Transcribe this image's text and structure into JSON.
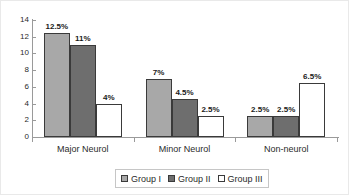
{
  "chart_data": {
    "type": "bar",
    "title": "",
    "xlabel": "",
    "ylabel": "",
    "ylim": [
      0,
      14
    ],
    "yticks": [
      0,
      2,
      4,
      6,
      8,
      10,
      12,
      14
    ],
    "grid": false,
    "legend_position": "bottom",
    "categories": [
      "Major Neurol",
      "Minor Neurol",
      "Non-neurol"
    ],
    "series": [
      {
        "name": "Group I",
        "color": "#a8a8a8",
        "values": [
          12.5,
          7,
          2.5
        ],
        "labels": [
          "12.5%",
          "7%",
          "2.5%"
        ]
      },
      {
        "name": "Group II",
        "color": "#6e6e6e",
        "values": [
          11,
          4.5,
          2.5
        ],
        "labels": [
          "11%",
          "4.5%",
          "2.5%"
        ]
      },
      {
        "name": "Group III",
        "color": "#ffffff",
        "values": [
          4,
          2.5,
          6.5
        ],
        "labels": [
          "4%",
          "2.5%",
          "6.5%"
        ]
      }
    ]
  },
  "axis": {
    "y_tick_labels": [
      "14",
      "12",
      "10",
      "8",
      "6",
      "4",
      "2",
      "0"
    ]
  },
  "categories": {
    "c0": "Major Neurol",
    "c1": "Minor Neurol",
    "c2": "Non-neurol"
  },
  "legend": {
    "items": [
      {
        "label": "Group I",
        "swatch": "legend-swatch-group-i"
      },
      {
        "label": "Group II",
        "swatch": "legend-swatch-group-ii"
      },
      {
        "label": "Group III",
        "swatch": "legend-swatch-group-iii"
      }
    ]
  },
  "bar_labels": {
    "g1c0": "12.5%",
    "g2c0": "11%",
    "g3c0": "4%",
    "g1c1": "7%",
    "g2c1": "4.5%",
    "g3c1": "2.5%",
    "g1c2": "2.5%",
    "g2c2": "2.5%",
    "g3c2": "6.5%"
  }
}
